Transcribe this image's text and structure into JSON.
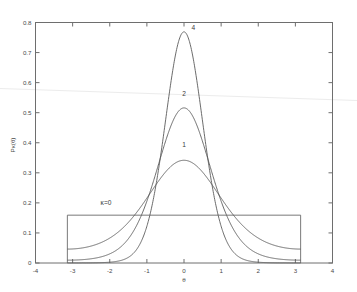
{
  "chart_data": {
    "type": "line",
    "title": "",
    "subtitle": "",
    "xlabel": "θ",
    "ylabel": "Pκ(θ)",
    "xlim": [
      -4,
      4
    ],
    "ylim": [
      0,
      0.8
    ],
    "grid": false,
    "legend_position": "inline-annotations",
    "xticks": [
      -4,
      -3,
      -2,
      -1,
      0,
      1,
      2,
      3,
      4
    ],
    "xticklabels": [
      "-4",
      "-3",
      "-2",
      "-1",
      "0",
      "1",
      "2",
      "3",
      "4"
    ],
    "yticks": [
      0,
      0.1,
      0.2,
      0.3,
      0.4,
      0.5,
      0.6,
      0.7,
      0.8
    ],
    "yticklabels": [
      "0",
      "0.1",
      "0.2",
      "0.3",
      "0.4",
      "0.5",
      "0.6",
      "0.7",
      "0.8"
    ],
    "distribution": "von Mises",
    "domain": [
      -3.14159265,
      3.14159265
    ],
    "series": [
      {
        "name": "1",
        "kappa": 1,
        "peak_x": 0,
        "peak_y": 0.3466,
        "edge_y": 0.0466,
        "annotation": "1",
        "annotation_x": 0.0,
        "annotation_y": 0.385
      },
      {
        "name": "2",
        "kappa": 2,
        "peak_x": 0,
        "peak_y": 0.516,
        "edge_y": 0.00942,
        "annotation": "2",
        "annotation_x": 0.0,
        "annotation_y": 0.555
      },
      {
        "name": "4",
        "kappa": 4,
        "peak_x": 0,
        "peak_y": 0.7632,
        "edge_y": 0.000257,
        "annotation": "4",
        "annotation_x": 0.25,
        "annotation_y": 0.775
      },
      {
        "name": "κ=0",
        "kappa": 0,
        "peak_x": 0,
        "peak_y": 0.15915,
        "edge_y": 0.15915,
        "annotation": "κ=0",
        "annotation_x": -2.1,
        "annotation_y": 0.192
      }
    ],
    "annotations": [
      {
        "text": "4",
        "x": 0.25,
        "y": 0.775
      },
      {
        "text": "2",
        "x": 0.0,
        "y": 0.555
      },
      {
        "text": "1",
        "x": 0.0,
        "y": 0.385
      },
      {
        "text": "κ=0",
        "x": -2.1,
        "y": 0.192
      }
    ]
  },
  "colors": {
    "background": "#ffffff",
    "axis": "#6e6e6e",
    "curve": "#5a5a5a",
    "text": "#4a4a4a",
    "artifact_line": "#ececec"
  }
}
